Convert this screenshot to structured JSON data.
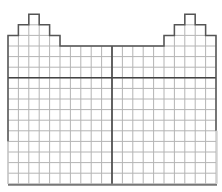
{
  "diagram": {
    "type": "grid-floorplan",
    "canvas": {
      "width": 222,
      "height": 192
    },
    "grid": {
      "left": 8,
      "top": 46,
      "cols": 20,
      "rows": 13,
      "cell_w": 10.4,
      "cell_h": 10.6
    },
    "towers": [
      {
        "side": "left",
        "cols": [
          0,
          1,
          2,
          3,
          4
        ],
        "extra_rows": [
          1,
          2,
          3,
          2,
          1
        ]
      },
      {
        "side": "right",
        "cols": [
          15,
          16,
          17,
          18,
          19
        ],
        "extra_rows": [
          1,
          2,
          3,
          2,
          1
        ]
      }
    ],
    "major_lines": {
      "horizontal_row": 3,
      "vertical_col": 10
    },
    "outline_dark_until_row": 9,
    "colors": {
      "background": "#ffffff",
      "minor_line": "#b4b4b4",
      "major_line": "#444444",
      "outline": "#555555",
      "bottom_line": "#777777",
      "lower_side_line": "#c8c8c8"
    }
  }
}
